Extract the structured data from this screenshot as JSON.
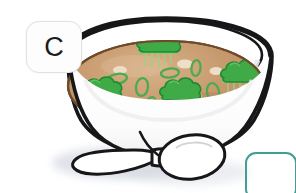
{
  "canvas": {
    "width": 296,
    "height": 193,
    "background_color": "#ffffff"
  },
  "badge": {
    "name": "option-label-badge",
    "letter": "C",
    "background_color": "#fdfdfd",
    "border_color": "#e2e2e2",
    "text_color": "#1d1d1d"
  },
  "teal_box": {
    "name": "answer-box",
    "border_color": "#3f9f94",
    "fill": "none",
    "clipped": "bottom-right"
  },
  "illustration": {
    "subject": "bowl-of-soup-with-spoon",
    "style": "hand-drawn-clipart",
    "outline_color": "#17171a",
    "colors": {
      "bowl_fill": "#ffffff",
      "broth_fill": "#c79a6e",
      "broth_shade": "#b2855c",
      "broth_highlight": "#dcc0a0",
      "garnish_green": "#3faa46",
      "garnish_green_dark": "#228b38",
      "garnish_stem": "#9dd17f",
      "scallion_ring": "#4fae53",
      "tofu_cube": "#eee0cc",
      "shadow": "#d7dbe2",
      "spoon_fill": "#ffffff"
    },
    "elements": [
      {
        "name": "bowl",
        "description": "wide white ceramic bowl with thick black outline"
      },
      {
        "name": "broth",
        "description": "tan miso broth filling the bowl"
      },
      {
        "name": "garnish-cluster-top",
        "description": "green broccoli floret garnish, upper center"
      },
      {
        "name": "garnish-cluster-left",
        "description": "green broccoli floret garnish, mid left"
      },
      {
        "name": "garnish-cluster-center",
        "description": "green broccoli floret garnish, center"
      },
      {
        "name": "garnish-cluster-right",
        "description": "green broccoli floret garnish, right"
      },
      {
        "name": "garnish-cluster-bottom",
        "description": "green broccoli floret garnish, bottom center"
      },
      {
        "name": "scallion-rings",
        "description": "eight green scallion ring slices floating on broth"
      },
      {
        "name": "tofu-cubes",
        "description": "pale cream tofu cubes in the broth"
      },
      {
        "name": "spoon",
        "description": "white spoon lying in front of the bowl, bowl end to the right"
      },
      {
        "name": "table-shadow",
        "description": "soft grey shadow beneath bowl and spoon"
      }
    ]
  }
}
